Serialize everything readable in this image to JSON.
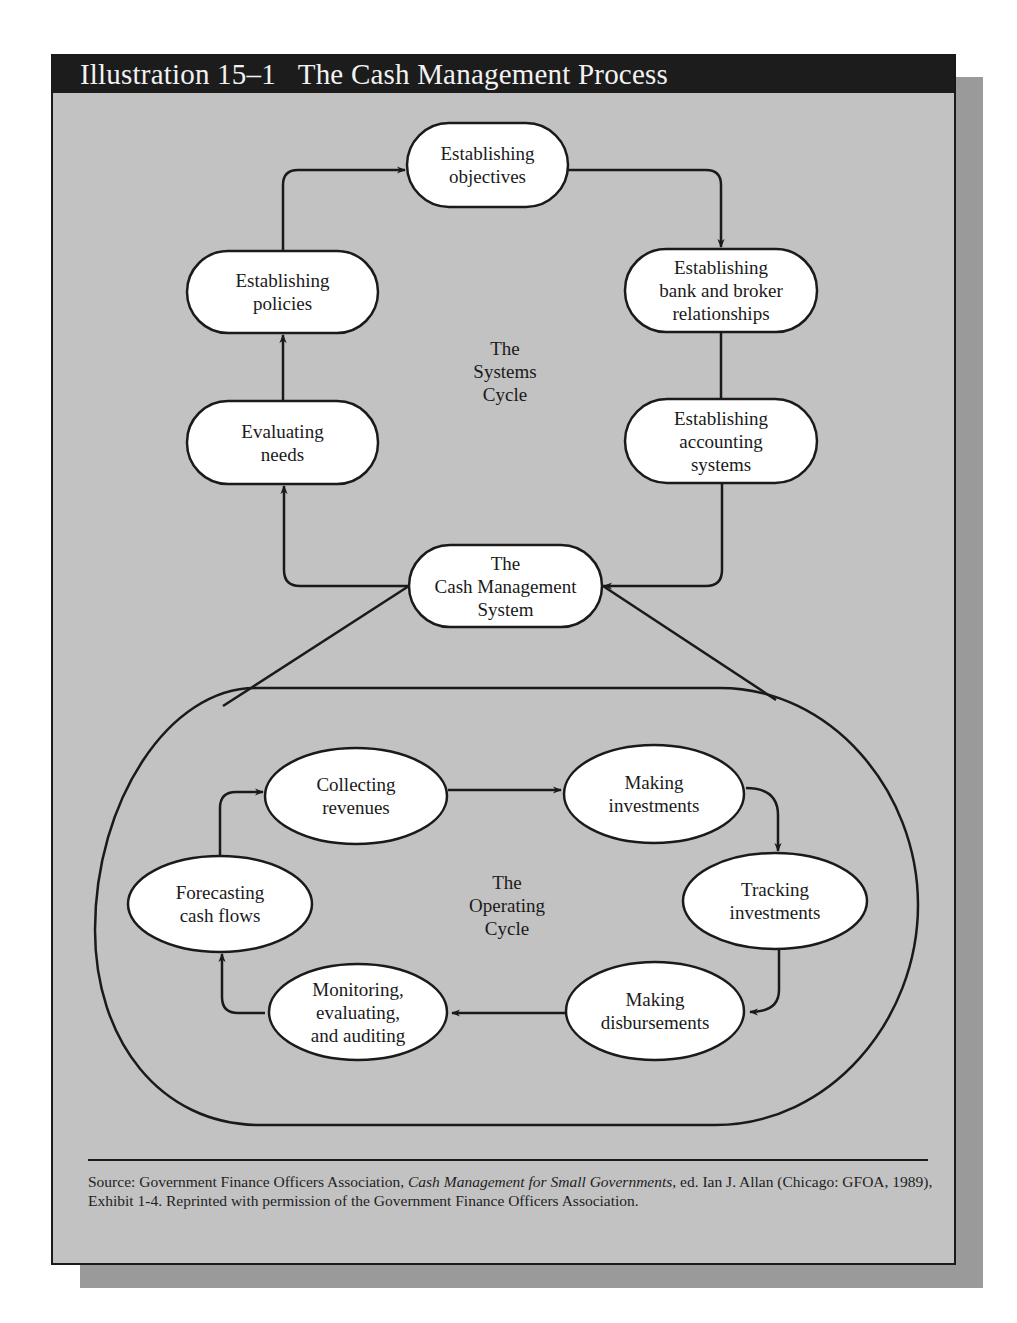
{
  "header": {
    "illustration_number": "Illustration 15–1",
    "title": "The Cash Management Process"
  },
  "systems_cycle": {
    "label": [
      "The",
      "Systems",
      "Cycle"
    ],
    "nodes": [
      {
        "id": "objectives",
        "lines": [
          "Establishing",
          "objectives"
        ]
      },
      {
        "id": "bank",
        "lines": [
          "Establishing",
          "bank and broker",
          "relationships"
        ]
      },
      {
        "id": "accounting",
        "lines": [
          "Establishing",
          "accounting",
          "systems"
        ]
      },
      {
        "id": "policies",
        "lines": [
          "Establishing",
          "policies"
        ]
      },
      {
        "id": "needs",
        "lines": [
          "Evaluating",
          "needs"
        ]
      }
    ]
  },
  "center_node": {
    "lines": [
      "The",
      "Cash Management",
      "System"
    ]
  },
  "operating_cycle": {
    "label": [
      "The",
      "Operating",
      "Cycle"
    ],
    "nodes": [
      {
        "id": "collecting",
        "lines": [
          "Collecting",
          "revenues"
        ]
      },
      {
        "id": "investments",
        "lines": [
          "Making",
          "investments"
        ]
      },
      {
        "id": "tracking",
        "lines": [
          "Tracking",
          "investments"
        ]
      },
      {
        "id": "disbursements",
        "lines": [
          "Making",
          "disbursements"
        ]
      },
      {
        "id": "monitoring",
        "lines": [
          "Monitoring,",
          "evaluating,",
          "and auditing"
        ]
      },
      {
        "id": "forecasting",
        "lines": [
          "Forecasting",
          "cash flows"
        ]
      }
    ]
  },
  "source": {
    "prefix": "Source: Government Finance Officers Association, ",
    "book_title": "Cash Management for Small Governments",
    "suffix": ", ed. Ian J. Allan (Chicago: GFOA, 1989), Exhibit 1-4. Reprinted with permission of the Government Finance Officers Association."
  },
  "colors": {
    "panel_background": "#c2c2c2",
    "header_background": "#1c1c1c",
    "shadow": "#9a9a9a",
    "node_fill": "#ffffff",
    "stroke": "#1a1a1a"
  }
}
